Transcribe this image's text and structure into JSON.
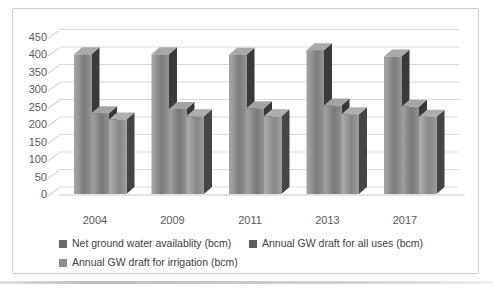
{
  "frame": {
    "border_color": "#cfcfcf",
    "background": "#ffffff"
  },
  "chart_data": {
    "type": "bar",
    "subtype": "3d-clustered-column",
    "title": "",
    "xlabel": "",
    "ylabel": "",
    "categories": [
      "2004",
      "2009",
      "2011",
      "2013",
      "2017"
    ],
    "series": [
      {
        "name": "Net  ground  water availablity (bcm)",
        "values": [
          399,
          399,
          398,
          411,
          393
        ],
        "colors": {
          "front_left": "#a0a0a0",
          "front_mid": "#7b7b7b",
          "front_right": "#949494",
          "side": "#3a3a3a",
          "top": "#a8a8a8",
          "legend_marker": "#696969"
        }
      },
      {
        "name": "Annual GW draft for all uses (bcm)",
        "values": [
          231,
          243,
          245,
          253,
          249
        ],
        "colors": {
          "front_left": "#9d9d9d",
          "front_mid": "#787878",
          "front_right": "#919191",
          "side": "#383838",
          "top": "#a4a4a4",
          "legend_marker": "#5e5e5e"
        }
      },
      {
        "name": "Annual GW draft for irrigation (bcm)",
        "values": [
          213,
          222,
          222,
          228,
          221
        ],
        "colors": {
          "front_left": "#a8a8a8",
          "front_mid": "#868686",
          "front_right": "#9c9c9c",
          "side": "#454545",
          "top": "#aeaeae",
          "legend_marker": "#8f8f8f"
        }
      }
    ],
    "ylim": [
      0,
      450
    ],
    "yticks": [
      0,
      50,
      100,
      150,
      200,
      250,
      300,
      350,
      400,
      450
    ],
    "grid": true,
    "gridline_color": "#d9d9d9",
    "tick_color": "#c9c9c9",
    "axis_text_color": "#595959",
    "legend_text_color": "#404040",
    "legend_position": "bottom-left"
  }
}
